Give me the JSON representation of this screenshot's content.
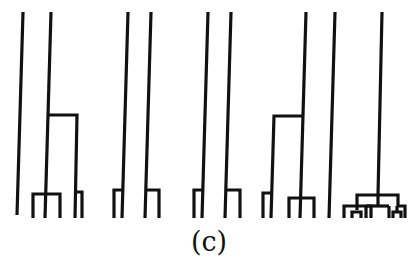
{
  "figure": {
    "caption": "(c)",
    "stroke_color": "#111111",
    "background": "#ffffff"
  },
  "trees": [
    {
      "id": "tree-1",
      "description": "two lines; right line has mid-height branch to the right and a 3-prong fork at bottom; branch ends in a 2-prong fork"
    },
    {
      "id": "tree-2",
      "description": "two lines, each with a small 2-prong fork at bottom"
    },
    {
      "id": "tree-3",
      "description": "two lines, each with a small 2-prong fork at bottom"
    },
    {
      "id": "tree-4",
      "description": "two lines; left line has mid-height branch to the left ending in a 2-prong fork and a 3-prong fork at bottom"
    },
    {
      "id": "tree-5",
      "description": "two lines; right line ends in a hierarchical multi-level fork"
    }
  ]
}
